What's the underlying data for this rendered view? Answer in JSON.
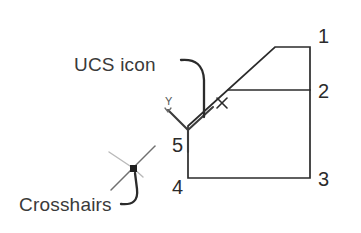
{
  "figure": {
    "background_color": "#ffffff",
    "line_color": "#2b2b2b",
    "crosshair_color": "#b9b9b9",
    "width": 361,
    "height": 233
  },
  "annotations": [
    {
      "id": "ucs-icon",
      "label": "UCS icon",
      "label_x": 74,
      "label_y": 71,
      "leader": "M 181 60 Q 203 58 204 80 L 204 117"
    },
    {
      "id": "crosshairs",
      "label": "Crosshairs",
      "label_x": 19,
      "label_y": 211,
      "leader": "M 121 204 Q 139 206 137 189 L 135 173"
    }
  ],
  "vertex_labels": [
    {
      "id": "vertex-1",
      "label": "1",
      "x": 318,
      "y": 43
    },
    {
      "id": "vertex-2",
      "label": "2",
      "x": 318,
      "y": 98
    },
    {
      "id": "vertex-3",
      "label": "3",
      "x": 318,
      "y": 186
    },
    {
      "id": "vertex-4",
      "label": "4",
      "x": 172,
      "y": 194
    },
    {
      "id": "vertex-5",
      "label": "5",
      "x": 172,
      "y": 152
    }
  ],
  "ucs_axis_label": {
    "label": "Y",
    "x": 165,
    "y": 105
  },
  "geometry": {
    "outline_path": "M 188 126 L 275 47 L 310 47 L 310 178 L 188 178 Z",
    "inner_horizontal_path": "M 228 90 L 310 90",
    "ucs_icon_path": "M 168 110 L 188 130 L 188 152 M 188 130 L 213 107",
    "ucs_tick_path": "M 165 108 L 168 112 L 171 108",
    "pick_marker": {
      "cx": 222,
      "cy": 103,
      "size": 6
    },
    "crosshairs": {
      "cx": 133,
      "cy": 168,
      "arm_upper_right": "M 133 168 L 155 146",
      "arm_lower_left": "M 133 168 L 111 190",
      "arm_upper_left": "M 133 168 L 109 152",
      "arm_lower_right": "M 133 168 L 143 177",
      "box_size": 7
    }
  }
}
